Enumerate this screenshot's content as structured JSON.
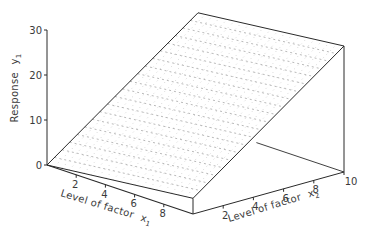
{
  "chart_data": {
    "type": "surface3d",
    "title": "",
    "zlabel": "Response y1",
    "xlabel": "Level of factor x1",
    "ylabel": "Level of factor x2",
    "axes": {
      "response": {
        "label": "Response",
        "subscript_var": "y",
        "subscript": "1",
        "ticks": [
          0,
          10,
          20,
          30
        ],
        "range": [
          0,
          30
        ]
      },
      "x1": {
        "label": "Level of factor",
        "subscript_var": "x",
        "subscript": "1",
        "ticks": [
          2,
          4,
          6,
          8
        ],
        "range": [
          0,
          10
        ]
      },
      "x2": {
        "label": "Level of factor",
        "subscript_var": "x",
        "subscript": "2",
        "ticks": [
          2,
          4,
          6,
          8,
          10
        ],
        "range": [
          0,
          10
        ]
      }
    },
    "surface": {
      "model": "planar",
      "equation_estimate": "y1 ≈ 0.35·x1 + 2.45·x2",
      "intercept": 0,
      "coef_x1": 0.35,
      "coef_x2": 2.45,
      "grid_steps": 20,
      "corners": [
        {
          "x1": 0,
          "x2": 0,
          "y": 0
        },
        {
          "x1": 10,
          "x2": 0,
          "y": 3.5
        },
        {
          "x1": 10,
          "x2": 10,
          "y": 28
        },
        {
          "x1": 0,
          "x2": 10,
          "y": 24.5
        }
      ]
    },
    "grid": false,
    "legend": null
  },
  "colors": {
    "line": "#2a2a2a",
    "grid": "#8a8a8a",
    "text": "#3a3a3a"
  }
}
